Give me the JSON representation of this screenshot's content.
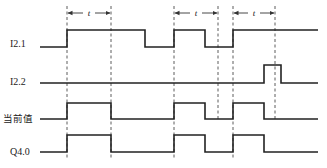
{
  "diagram": {
    "type": "timing-diagram",
    "signals": [
      {
        "name": "I2.1",
        "label": "I2.1",
        "y_high": 30,
        "y_low": 47,
        "label_y": 47,
        "points": [
          [
            40,
            "L"
          ],
          [
            67,
            "H"
          ],
          [
            145,
            "L"
          ],
          [
            174,
            "H"
          ],
          [
            205,
            "L"
          ],
          [
            233,
            "H"
          ],
          [
            318,
            "H"
          ]
        ]
      },
      {
        "name": "I2.2",
        "label": "I2.2",
        "y_high": 65,
        "y_low": 83,
        "label_y": 85,
        "points": [
          [
            40,
            "L"
          ],
          [
            264,
            "H"
          ],
          [
            281,
            "L"
          ],
          [
            318,
            "L"
          ]
        ]
      },
      {
        "name": "current-value",
        "label": "当前值",
        "y_high": 103,
        "y_low": 119,
        "label_y": 122,
        "points": [
          [
            40,
            "L"
          ],
          [
            67,
            "H"
          ],
          [
            111,
            "L"
          ],
          [
            174,
            "H"
          ],
          [
            205,
            "L"
          ],
          [
            233,
            "H"
          ],
          [
            264,
            "L"
          ],
          [
            318,
            "L"
          ]
        ]
      },
      {
        "name": "Q4.0",
        "label": "Q4.0",
        "y_high": 135,
        "y_low": 152,
        "label_y": 155,
        "points": [
          [
            40,
            "L"
          ],
          [
            67,
            "H"
          ],
          [
            111,
            "L"
          ],
          [
            174,
            "H"
          ],
          [
            205,
            "L"
          ],
          [
            233,
            "H"
          ],
          [
            264,
            "L"
          ],
          [
            318,
            "L"
          ]
        ]
      }
    ],
    "dashed_lines": [
      {
        "x": 67,
        "y1": 6,
        "y2": 160
      },
      {
        "x": 111,
        "y1": 6,
        "y2": 160
      },
      {
        "x": 174,
        "y1": 6,
        "y2": 160
      },
      {
        "x": 218,
        "y1": 6,
        "y2": 121
      },
      {
        "x": 233,
        "y1": 6,
        "y2": 160
      },
      {
        "x": 275,
        "y1": 6,
        "y2": 121
      }
    ],
    "t_annotations": [
      {
        "x1": 67,
        "x2": 111,
        "y": 13,
        "label": "t"
      },
      {
        "x1": 174,
        "x2": 218,
        "y": 13,
        "label": "t"
      },
      {
        "x1": 233,
        "x2": 275,
        "y": 13,
        "label": "t"
      }
    ]
  }
}
